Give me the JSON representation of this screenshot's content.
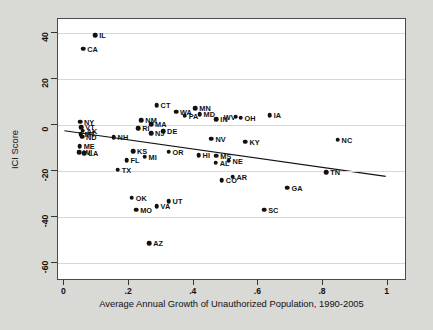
{
  "chart_data": {
    "type": "scatter",
    "title": "",
    "xlabel": "Average Annual Growth of Unauthorized Population, 1990-2005",
    "ylabel": "ICI Score",
    "xlim": [
      -0.02,
      1.06
    ],
    "ylim": [
      -68,
      46
    ],
    "xticks": [
      "0",
      ".2",
      ".4",
      ".6",
      ".8",
      "1"
    ],
    "xtickvals": [
      0,
      0.2,
      0.4,
      0.6,
      0.8,
      1
    ],
    "yticks": [
      "40",
      "20",
      "0",
      "-20",
      "-40",
      "-60"
    ],
    "ytickvals": [
      40,
      20,
      0,
      -20,
      -40,
      -60
    ],
    "grid": "horizontal",
    "legend": "none",
    "point_color": "#111111",
    "line_color": "#111111",
    "plot_bg": "#ffffff",
    "figure_bg": "#d9d9d6",
    "fit_line": {
      "x0": 0,
      "y0": -3.0,
      "x1": 1.0,
      "y1": -23.0
    },
    "points": [
      {
        "label": "IL",
        "x": 0.095,
        "y": 39.0,
        "lx": 4
      },
      {
        "label": "CA",
        "x": 0.058,
        "y": 33.0,
        "lx": 4
      },
      {
        "label": "CT",
        "x": 0.285,
        "y": 8.5,
        "lx": 4
      },
      {
        "label": "MN",
        "x": 0.405,
        "y": 7.2,
        "lx": 4
      },
      {
        "label": "WA",
        "x": 0.345,
        "y": 5.6,
        "lx": 4
      },
      {
        "label": "MD",
        "x": 0.418,
        "y": 4.6,
        "lx": 4
      },
      {
        "label": "PA",
        "x": 0.372,
        "y": 4.0,
        "lx": 4
      },
      {
        "label": "IA",
        "x": 0.635,
        "y": 4.2,
        "lx": 4
      },
      {
        "label": "OH",
        "x": 0.545,
        "y": 3.0,
        "lx": 4
      },
      {
        "label": "WV",
        "x": 0.53,
        "y": 3.4,
        "lx": -12
      },
      {
        "label": "IN",
        "x": 0.47,
        "y": 2.4,
        "lx": 4
      },
      {
        "label": "NM",
        "x": 0.238,
        "y": 2.0,
        "lx": 4
      },
      {
        "label": "MA",
        "x": 0.268,
        "y": 0.2,
        "lx": 4
      },
      {
        "label": "NY",
        "x": 0.048,
        "y": 1.4,
        "lx": 4
      },
      {
        "label": "RI",
        "x": 0.228,
        "y": -1.4,
        "lx": 4
      },
      {
        "label": "VT",
        "x": 0.052,
        "y": -1.0,
        "lx": 4
      },
      {
        "label": "AK",
        "x": 0.056,
        "y": -2.6,
        "lx": 4
      },
      {
        "label": "NJ",
        "x": 0.268,
        "y": -3.6,
        "lx": 4
      },
      {
        "label": "DE",
        "x": 0.305,
        "y": -2.8,
        "lx": 4
      },
      {
        "label": "NV",
        "x": 0.455,
        "y": -6.0,
        "lx": 4
      },
      {
        "label": "KY",
        "x": 0.56,
        "y": -7.4,
        "lx": 4
      },
      {
        "label": "NC",
        "x": 0.845,
        "y": -6.6,
        "lx": 4
      },
      {
        "label": "MT",
        "x": 0.05,
        "y": -4.0,
        "lx": 4
      },
      {
        "label": "ND",
        "x": 0.054,
        "y": -5.2,
        "lx": 4
      },
      {
        "label": "NH",
        "x": 0.152,
        "y": -5.4,
        "lx": 4
      },
      {
        "label": "ME",
        "x": 0.047,
        "y": -9.4,
        "lx": 4
      },
      {
        "label": "WI",
        "x": 0.046,
        "y": -12.0,
        "lx": 4
      },
      {
        "label": "LA",
        "x": 0.062,
        "y": -12.4,
        "lx": 4
      },
      {
        "label": "KS",
        "x": 0.212,
        "y": -11.4,
        "lx": 4
      },
      {
        "label": "OR",
        "x": 0.322,
        "y": -11.8,
        "lx": 4
      },
      {
        "label": "HI",
        "x": 0.415,
        "y": -13.2,
        "lx": 4
      },
      {
        "label": "MS",
        "x": 0.47,
        "y": -13.4,
        "lx": 4
      },
      {
        "label": "MI",
        "x": 0.248,
        "y": -14.0,
        "lx": 4
      },
      {
        "label": "FL",
        "x": 0.192,
        "y": -15.4,
        "lx": 4
      },
      {
        "label": "NE",
        "x": 0.508,
        "y": -15.6,
        "lx": 4
      },
      {
        "label": "AL",
        "x": 0.468,
        "y": -16.6,
        "lx": 4
      },
      {
        "label": "TX",
        "x": 0.165,
        "y": -19.6,
        "lx": 4
      },
      {
        "label": "TN",
        "x": 0.81,
        "y": -20.6,
        "lx": 4
      },
      {
        "label": "AR",
        "x": 0.52,
        "y": -22.6,
        "lx": 4
      },
      {
        "label": "CO",
        "x": 0.487,
        "y": -24.2,
        "lx": 4
      },
      {
        "label": "GA",
        "x": 0.69,
        "y": -27.4,
        "lx": 4
      },
      {
        "label": "OK",
        "x": 0.208,
        "y": -31.8,
        "lx": 4
      },
      {
        "label": "UT",
        "x": 0.322,
        "y": -33.4,
        "lx": 4
      },
      {
        "label": "VA",
        "x": 0.285,
        "y": -35.4,
        "lx": 4
      },
      {
        "label": "MO",
        "x": 0.222,
        "y": -37.0,
        "lx": 4
      },
      {
        "label": "SC",
        "x": 0.618,
        "y": -37.0,
        "lx": 4
      },
      {
        "label": "AZ",
        "x": 0.262,
        "y": -51.6,
        "lx": 4
      }
    ]
  }
}
